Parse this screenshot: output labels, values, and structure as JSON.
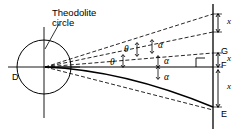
{
  "diagram": {
    "title_label": "Theodolite\ncircle",
    "points": {
      "station": "D",
      "upper": "G",
      "middle": "F",
      "lower": "E"
    },
    "angles": {
      "theta_upper": "θ",
      "theta_lower": "θ",
      "alpha_upper": "α",
      "alpha_middle": "α",
      "alpha_lower": "α"
    },
    "dimensions": {
      "top": "x",
      "middle": "x",
      "bottom": "x"
    },
    "colors": {
      "line": "#000000",
      "background": "#ffffff"
    }
  }
}
